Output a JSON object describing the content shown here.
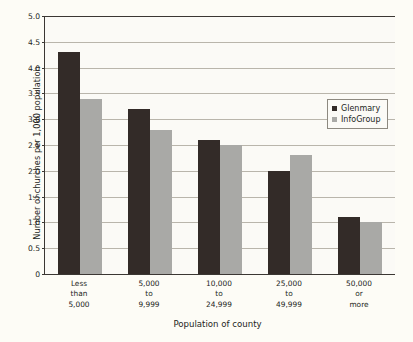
{
  "chart_data": {
    "type": "bar",
    "title": "",
    "xlabel": "Population of county",
    "ylabel": "Number of churches per 1,000 population",
    "categories": [
      "Less\nthan\n5,000",
      "5,000\nto\n9,999",
      "10,000\nto\n24,999",
      "25,000\nto\n49,999",
      "50,000\nor\nmore"
    ],
    "category_lines": [
      [
        "Less",
        "than",
        "5,000"
      ],
      [
        "5,000",
        "to",
        "9,999"
      ],
      [
        "10,000",
        "to",
        "24,999"
      ],
      [
        "25,000",
        "to",
        "49,999"
      ],
      [
        "50,000",
        "or",
        "more"
      ]
    ],
    "series": [
      {
        "name": "Glenmary",
        "color": "#332b28",
        "values": [
          4.3,
          3.2,
          2.6,
          2.0,
          1.1
        ]
      },
      {
        "name": "InfoGroup",
        "color": "#a9a9a6",
        "values": [
          3.4,
          2.8,
          2.5,
          2.3,
          1.0
        ]
      }
    ],
    "ylim": [
      0,
      5.0
    ],
    "ytick_values": [
      0,
      0.5,
      1.0,
      1.5,
      2.0,
      2.5,
      3.0,
      3.5,
      4.0,
      4.5,
      5.0
    ],
    "ytick_labels": [
      "0",
      "0.5",
      "1.0",
      "1.5",
      "2.0",
      "2.5",
      "3.0",
      "3.5",
      "4.0",
      "4.5",
      "5.0"
    ],
    "grid": true,
    "legend_position": "inside-top-right"
  },
  "axes": {
    "y_title": "Number of churches per 1,000 population",
    "x_title": "Population of county"
  },
  "legend": {
    "entries": [
      {
        "label": "Glenmary",
        "swatch": "glenmary"
      },
      {
        "label": "InfoGroup",
        "swatch": "infogroup"
      }
    ]
  },
  "colors": {
    "glenmary": "#332b28",
    "infogroup": "#a9a9a6",
    "plot_background": "#fbfaf6",
    "page_background": "#fdfcf6",
    "gridline": "#b9b5ab",
    "axis": "#3b3733"
  }
}
